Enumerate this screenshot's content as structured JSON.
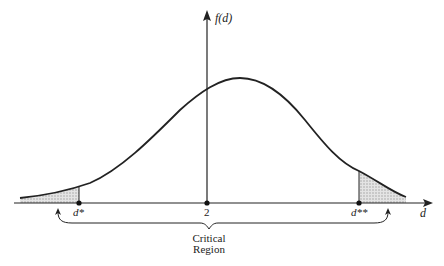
{
  "figure": {
    "y_axis_label": "f(d)",
    "x_axis_label": "d",
    "ticks": {
      "lower_critical": "d*",
      "center": "2",
      "upper_critical": "d**"
    },
    "region_label_line1": "Critical",
    "region_label_line2": "Region",
    "colors": {
      "line": "#222222",
      "shading": "#bdbdbd"
    }
  }
}
